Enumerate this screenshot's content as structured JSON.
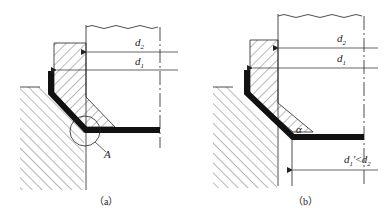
{
  "figure": {
    "panels": [
      {
        "id": "a",
        "caption": "（a）",
        "labels": {
          "d2": "d",
          "d2_sub": "2",
          "d1": "d",
          "d1_sub": "1",
          "detail": "A"
        }
      },
      {
        "id": "b",
        "caption": "（b）",
        "labels": {
          "d2": "d",
          "d2_sub": "2",
          "d1": "d",
          "d1_sub": "1",
          "angle": "α",
          "relation_a": "d",
          "relation_a_sub": "1",
          "relation_prime": "′",
          "relation_op": "<",
          "relation_b": "d",
          "relation_b_sub": "2"
        }
      }
    ],
    "colors": {
      "line": "#222222",
      "fill": "#111111",
      "background": "#ffffff"
    }
  }
}
